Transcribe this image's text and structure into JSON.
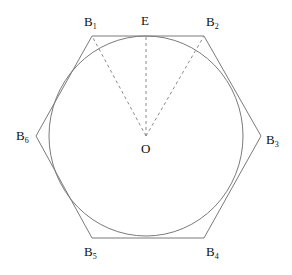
{
  "diagram": {
    "center": {
      "label": "O",
      "x": 146,
      "y": 136
    },
    "circle": {
      "cx": 146,
      "cy": 136,
      "rx": 97,
      "ry": 100,
      "stroke": "#7a7a7a"
    },
    "hexagon": {
      "stroke": "#7a7a7a",
      "vertices": [
        {
          "name": "B1",
          "base": "B",
          "sub": "1",
          "x": 92,
          "y": 36,
          "lx": 84,
          "ly": 26
        },
        {
          "name": "B2",
          "base": "B",
          "sub": "2",
          "x": 204,
          "y": 36,
          "lx": 206,
          "ly": 26
        },
        {
          "name": "B3",
          "base": "B",
          "sub": "3",
          "x": 261,
          "y": 136,
          "lx": 266,
          "ly": 144
        },
        {
          "name": "B4",
          "base": "B",
          "sub": "4",
          "x": 204,
          "y": 238,
          "lx": 206,
          "ly": 256
        },
        {
          "name": "B5",
          "base": "B",
          "sub": "5",
          "x": 92,
          "y": 238,
          "lx": 84,
          "ly": 256
        },
        {
          "name": "B6",
          "base": "B",
          "sub": "6",
          "x": 36,
          "y": 136,
          "lx": 16,
          "ly": 140
        }
      ]
    },
    "tangent_point": {
      "label": "E",
      "x": 146,
      "y": 36,
      "lx": 141,
      "ly": 25
    },
    "dashed_segments": [
      {
        "from": "O",
        "to": "B1"
      },
      {
        "from": "O",
        "to": "E"
      },
      {
        "from": "O",
        "to": "B2"
      }
    ],
    "dash_color": "#8a8a8a"
  }
}
